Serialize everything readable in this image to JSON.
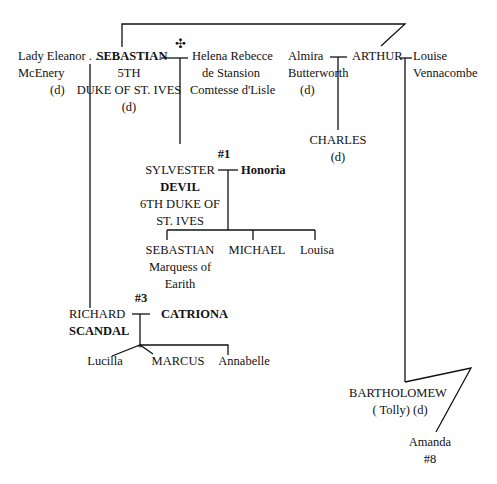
{
  "people": {
    "eleanor": {
      "line1": "Lady Eleanor . . .",
      "line2": "McEnery",
      "line3": "(d)"
    },
    "sebastian5": {
      "name": "SEBASTIAN",
      "line2": "5TH",
      "line3": "DUKE OF ST. IVES",
      "line4": "(d)"
    },
    "helena": {
      "line1": "Helena Rebecce",
      "line2": "de Stansion",
      "line3": "Comtesse d'Lisle"
    },
    "marriage_symbol": "✣",
    "almira": {
      "line1": "Almira",
      "line2": "Butterworth",
      "line3": "(d)"
    },
    "arthur": {
      "name": "ARTHUR"
    },
    "louise": {
      "line1": "Louise",
      "line2": "Vennacombe"
    },
    "charles": {
      "name": "CHARLES",
      "line2": "(d)"
    },
    "sylvester": {
      "book": "#1",
      "line1": "SYLVESTER",
      "line2": "DEVIL",
      "line3": "6TH DUKE OF",
      "line4": "ST. IVES"
    },
    "honoria": {
      "name": "Honoria"
    },
    "sebastian_m": {
      "name": "SEBASTIAN",
      "line2": "Marquess of",
      "line3": "Earith"
    },
    "michael": {
      "name": "MICHAEL"
    },
    "louisa": {
      "name": "Louisa"
    },
    "richard": {
      "book": "#3",
      "line1": "RICHARD",
      "line2": "SCANDAL"
    },
    "catriona": {
      "name": "CATRIONA"
    },
    "twins_marker": "*",
    "lucilla": {
      "name": "Lucilla"
    },
    "marcus": {
      "name": "MARCUS"
    },
    "annabelle": {
      "name": "Annabelle"
    },
    "bartholomew": {
      "name": "BARTHOLOMEW",
      "line2": "( Tolly) (d)"
    },
    "amanda": {
      "name": "Amanda",
      "book": "#8"
    }
  }
}
